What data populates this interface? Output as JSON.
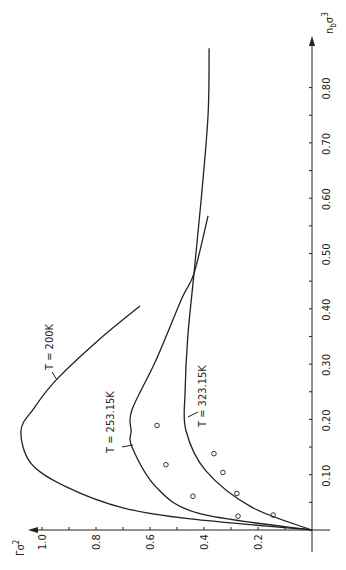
{
  "chart_data": {
    "type": "line",
    "orientation": "rotated-90-ccw",
    "title": "",
    "xlabel": "n_b σ³",
    "ylabel": "Γ σ²",
    "xlim": [
      0,
      0.87
    ],
    "ylim": [
      0,
      1.1
    ],
    "x_ticks": [
      "0.10",
      "0.20",
      "0.30",
      "0.40",
      "0.50",
      "0.60",
      "0.70",
      "0.80"
    ],
    "y_ticks": [
      "0.2",
      "0.4",
      "0.6",
      "0.8",
      "1.0"
    ],
    "grid": false,
    "legend": "inline labels",
    "series": [
      {
        "name": "T = 200 K",
        "label": "T = 200K",
        "style": "solid-line",
        "points": [
          [
            0,
            0
          ],
          [
            0.02,
            0.45
          ],
          [
            0.04,
            0.7
          ],
          [
            0.078,
            0.91
          ],
          [
            0.12,
            1.04
          ],
          [
            0.179,
            1.078
          ],
          [
            0.22,
            1.03
          ],
          [
            0.271,
            0.948
          ],
          [
            0.344,
            0.789
          ],
          [
            0.405,
            0.637
          ]
        ]
      },
      {
        "name": "T = 253.15 K",
        "label": "T = 253.15K",
        "style": "solid-line",
        "points": [
          [
            0,
            0
          ],
          [
            0.03,
            0.419
          ],
          [
            0.078,
            0.578
          ],
          [
            0.15,
            0.667
          ],
          [
            0.179,
            0.67
          ],
          [
            0.217,
            0.667
          ],
          [
            0.307,
            0.578
          ],
          [
            0.42,
            0.481
          ],
          [
            0.464,
            0.437
          ],
          [
            0.568,
            0.385
          ]
        ]
      },
      {
        "name": "T = 323.15 K",
        "label": "T = 323.15K",
        "style": "solid-line",
        "points": [
          [
            0,
            0
          ],
          [
            0.041,
            0.222
          ],
          [
            0.107,
            0.393
          ],
          [
            0.18,
            0.467
          ],
          [
            0.25,
            0.47
          ],
          [
            0.35,
            0.46
          ],
          [
            0.464,
            0.437
          ],
          [
            0.6,
            0.41
          ],
          [
            0.75,
            0.385
          ],
          [
            0.871,
            0.381
          ]
        ]
      },
      {
        "name": "experimental",
        "style": "open-circle-markers",
        "points": [
          [
            0.189,
            0.574
          ],
          [
            0.118,
            0.541
          ],
          [
            0.061,
            0.441
          ],
          [
            0.138,
            0.363
          ],
          [
            0.104,
            0.33
          ],
          [
            0.066,
            0.278
          ],
          [
            0.025,
            0.274
          ],
          [
            0.027,
            0.144
          ]
        ]
      }
    ]
  },
  "labels": {
    "x_axis": "n",
    "x_axis_sub": "b",
    "x_axis_sym": "σ",
    "x_axis_sup": "3",
    "y_axis": "Γ",
    "y_axis_sym": "σ",
    "y_axis_sup": "2",
    "curve_200": "T = 200K",
    "curve_253": "T = 253.15K",
    "curve_323": "T = 323.15K"
  },
  "ticks": {
    "x": [
      "0.10",
      "0.20",
      "0.30",
      "0.40",
      "0.50",
      "0.60",
      "0.70",
      "0.80"
    ],
    "y": [
      "0.2",
      "0.4",
      "0.6",
      "0.8",
      "1.0"
    ]
  }
}
